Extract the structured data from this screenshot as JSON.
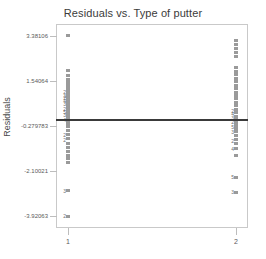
{
  "chart_data": {
    "type": "scatter",
    "title": "Residuals vs. Type of putter",
    "xlabel": "",
    "ylabel": "Residuals",
    "grid": false,
    "legend": null,
    "x_categories": [
      "1",
      "2"
    ],
    "y_tick_labels": [
      "3.38106",
      "1.54064",
      "-0.279783",
      "-2.10021",
      "-3.92063"
    ],
    "y_tick_values": [
      3.38106,
      1.54064,
      -0.279783,
      -2.10021,
      -3.92063
    ],
    "ylim": [
      -4.4,
      3.85
    ],
    "reference_line_value": 0.0,
    "series": [
      {
        "name": "1",
        "x": 1,
        "values": [
          3.38106,
          1.95,
          1.78,
          1.62,
          1.48,
          1.36,
          1.24,
          1.12,
          1.0,
          0.9,
          0.8,
          0.7,
          0.6,
          0.5,
          0.4,
          0.3,
          0.2,
          0.1,
          0.0,
          -0.1,
          -0.2,
          -0.3,
          -0.45,
          -0.6,
          -0.8,
          -1.0,
          -1.15,
          -1.3,
          -1.45,
          -1.6,
          -1.75,
          -2.9,
          -3.92063
        ],
        "counts": [
          {
            "value": 1.1,
            "label": "2"
          },
          {
            "value": 0.95,
            "label": "3"
          },
          {
            "value": 0.85,
            "label": "2"
          },
          {
            "value": 0.72,
            "label": "4"
          },
          {
            "value": 0.6,
            "label": "3"
          },
          {
            "value": 0.42,
            "label": "2"
          },
          {
            "value": 0.3,
            "label": "5"
          },
          {
            "value": 0.15,
            "label": "3"
          },
          {
            "value": -0.05,
            "label": "4"
          },
          {
            "value": -0.65,
            "label": "2"
          },
          {
            "value": -0.85,
            "label": "2"
          },
          {
            "value": -2.9,
            "label": "3"
          },
          {
            "value": -3.92063,
            "label": "2"
          }
        ]
      },
      {
        "name": "2",
        "x": 2,
        "values": [
          3.2,
          3.02,
          2.86,
          2.7,
          2.54,
          2.1,
          1.94,
          1.8,
          1.66,
          1.52,
          1.38,
          1.24,
          1.1,
          0.96,
          0.82,
          0.68,
          0.54,
          0.4,
          0.26,
          0.12,
          0.0,
          -0.12,
          -0.24,
          -0.36,
          -0.5,
          -0.66,
          -0.82,
          -1.0,
          -1.2,
          -1.45,
          -2.35,
          -2.95
        ],
        "counts": [
          {
            "value": 0.34,
            "label": "2"
          },
          {
            "value": 0.2,
            "label": "4"
          },
          {
            "value": 0.06,
            "label": "3"
          },
          {
            "value": -0.1,
            "label": "2"
          },
          {
            "value": -0.3,
            "label": "5"
          },
          {
            "value": -0.5,
            "label": "3"
          },
          {
            "value": -0.9,
            "label": "2"
          },
          {
            "value": -1.2,
            "label": "4"
          },
          {
            "value": -2.35,
            "label": "5"
          },
          {
            "value": -2.95,
            "label": "3"
          }
        ]
      }
    ]
  }
}
